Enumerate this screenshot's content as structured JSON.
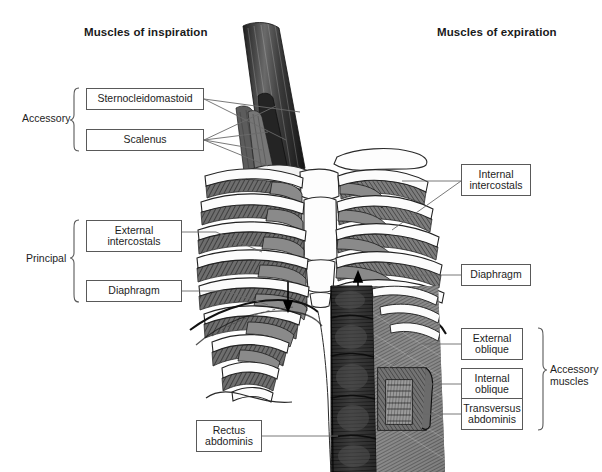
{
  "figure": {
    "title_left": "Muscles of inspiration",
    "title_right": "Muscles of expiration",
    "type": "anatomical-illustration",
    "background_color": "#ffffff",
    "line_color": "#595959",
    "text_color": "#1d1d1d"
  },
  "groups": {
    "accessory_inspiration": "Accessory",
    "principal_inspiration": "Principal",
    "accessory_expiration": "Accessory\nmuscles"
  },
  "labels": {
    "sternocleidomastoid": "Sternocleidomastoid",
    "scalenus": "Scalenus",
    "external_intercostals": "External\nintercostals",
    "diaphragm_left": "Diaphragm",
    "internal_intercostals": "Internal\nintercostals",
    "diaphragm_right": "Diaphragm",
    "external_oblique": "External\noblique",
    "internal_oblique": "Internal\noblique",
    "transversus_abdominis": "Transversus\nabdominis",
    "rectus_abdominis": "Rectus\nabdominis"
  },
  "label_boxes": [
    {
      "key": "sternocleidomastoid",
      "x": 86,
      "y": 88,
      "w": 118,
      "h": 22,
      "lines": 1
    },
    {
      "key": "scalenus",
      "x": 86,
      "y": 129,
      "w": 118,
      "h": 22,
      "lines": 1
    },
    {
      "key": "external_intercostals",
      "x": 86,
      "y": 220,
      "w": 96,
      "h": 32,
      "lines": 2
    },
    {
      "key": "diaphragm_left",
      "x": 86,
      "y": 280,
      "w": 96,
      "h": 22,
      "lines": 1
    },
    {
      "key": "internal_intercostals",
      "x": 461,
      "y": 164,
      "w": 70,
      "h": 32,
      "lines": 2
    },
    {
      "key": "diaphragm_right",
      "x": 461,
      "y": 264,
      "w": 70,
      "h": 22,
      "lines": 1
    },
    {
      "key": "external_oblique",
      "x": 461,
      "y": 328,
      "w": 62,
      "h": 32,
      "lines": 2
    },
    {
      "key": "internal_oblique",
      "x": 461,
      "y": 368,
      "w": 62,
      "h": 32,
      "lines": 2
    },
    {
      "key": "transversus_abdominis",
      "x": 461,
      "y": 398,
      "w": 62,
      "h": 32,
      "lines": 2
    },
    {
      "key": "rectus_abdominis",
      "x": 196,
      "y": 420,
      "w": 66,
      "h": 32,
      "lines": 2
    }
  ],
  "anatomy_parts": [
    "sternocleidomastoid-muscle",
    "scalene-muscles",
    "clavicle",
    "sternum",
    "manubrium",
    "ribs",
    "costal-cartilage",
    "external-intercostal-muscles",
    "internal-intercostal-muscles",
    "diaphragm-dome",
    "diaphragm-motion-arrow",
    "external-oblique-muscle",
    "internal-oblique-muscle",
    "transversus-abdominis-muscle",
    "rectus-abdominis-muscle"
  ]
}
